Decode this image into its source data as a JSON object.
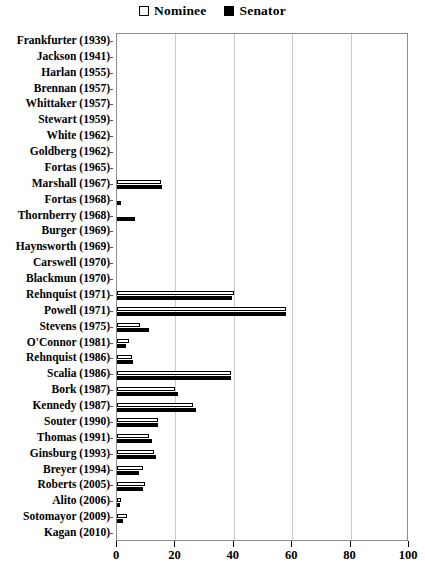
{
  "chart_data": {
    "type": "bar",
    "orientation": "horizontal",
    "title": "",
    "xlabel": "",
    "ylabel": "",
    "xlim": [
      0,
      100
    ],
    "xticks": [
      0,
      20,
      40,
      60,
      80,
      100
    ],
    "grid": true,
    "legend_position": "top-center",
    "legend": [
      {
        "name": "Nominee",
        "style": "hollow-square"
      },
      {
        "name": "Senator",
        "style": "filled-square"
      }
    ],
    "categories": [
      "Frankfurter (1939)",
      "Jackson (1941)",
      "Harlan (1955)",
      "Brennan (1957)",
      "Whittaker (1957)",
      "Stewart (1959)",
      "White (1962)",
      "Goldberg (1962)",
      "Fortas (1965)",
      "Marshall (1967)",
      "Fortas (1968)",
      "Thornberry (1968)",
      "Burger (1969)",
      "Haynsworth (1969)",
      "Carswell (1970)",
      "Blackmun (1970)",
      "Rehnquist (1971)",
      "Powell (1971)",
      "Stevens (1975)",
      "O'Connor (1981)",
      "Rehnquist (1986)",
      "Scalia (1986)",
      "Bork (1987)",
      "Kennedy (1987)",
      "Souter (1990)",
      "Thomas (1991)",
      "Ginsburg (1993)",
      "Breyer (1994)",
      "Roberts (2005)",
      "Alito (2006)",
      "Sotomayor (2009)",
      "Kagan (2010)"
    ],
    "series": [
      {
        "name": "Nominee",
        "values": [
          0,
          0,
          0,
          0,
          0,
          0,
          0,
          0,
          0,
          15,
          0,
          0,
          0,
          0,
          0,
          0,
          40,
          58,
          8,
          4,
          5,
          39,
          20,
          26,
          14,
          11,
          12.5,
          9,
          9.5,
          1.5,
          3.5,
          0
        ]
      },
      {
        "name": "Senator",
        "values": [
          0,
          0,
          0,
          0,
          0,
          0,
          0,
          0,
          0,
          15.5,
          1.5,
          6,
          0,
          0,
          0,
          0,
          39.5,
          58,
          11,
          3,
          5.5,
          39,
          21,
          27,
          14,
          12,
          13.5,
          7.5,
          9,
          1,
          2,
          0
        ]
      }
    ]
  }
}
